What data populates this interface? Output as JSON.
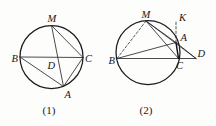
{
  "document": {
    "kind": "geometry-figure-pair",
    "background_color": "#fdfdfc",
    "ink_color": "#1b1b1e",
    "width": 216,
    "height": 126
  },
  "figures": [
    {
      "id": "figure-1",
      "caption": "(1)",
      "caption_pos": {
        "x": 49,
        "y": 114
      },
      "circle": {
        "cx": 51.5,
        "cy": 57,
        "r": 31.5
      },
      "points": [
        {
          "name": "M",
          "label": "M",
          "x": 51.5,
          "y": 25.5,
          "label_x": 47.5,
          "label_y": 21.5
        },
        {
          "name": "B",
          "label": "B",
          "x": 20.0,
          "y": 57.0,
          "label_x": 11.5,
          "label_y": 62.0
        },
        {
          "name": "C",
          "label": "C",
          "x": 83.0,
          "y": 57.5,
          "label_x": 85.0,
          "label_y": 62.0
        },
        {
          "name": "A",
          "label": "A",
          "x": 63.5,
          "y": 86.5,
          "label_x": 64.5,
          "label_y": 97.5
        },
        {
          "name": "D",
          "label": "D",
          "x": 53.5,
          "y": 57.2,
          "label_x": 47.5,
          "label_y": 69.0
        }
      ],
      "segments": [
        {
          "name": "BC",
          "from": "B",
          "to": "C",
          "style": "solid"
        },
        {
          "name": "MA",
          "from": "M",
          "to": "A",
          "style": "solid"
        },
        {
          "name": "MC",
          "from": "M",
          "to": "C",
          "style": "solid"
        },
        {
          "name": "BA",
          "from": "B",
          "to": "A",
          "style": "solid"
        },
        {
          "name": "AC",
          "from": "A",
          "to": "C",
          "style": "solid"
        }
      ]
    },
    {
      "id": "figure-2",
      "caption": "(2)",
      "caption_pos": {
        "x": 146,
        "y": 114
      },
      "circle": {
        "cx": 148.0,
        "cy": 52.5,
        "r": 32.0
      },
      "points": [
        {
          "name": "M",
          "label": "M",
          "x": 146.0,
          "y": 21.0,
          "label_x": 141.5,
          "label_y": 18.0
        },
        {
          "name": "B",
          "label": "B",
          "x": 117.0,
          "y": 58.5,
          "label_x": 108.5,
          "label_y": 63.5
        },
        {
          "name": "C",
          "label": "C",
          "x": 178.5,
          "y": 58.5,
          "label_x": 176.0,
          "label_y": 69.0
        },
        {
          "name": "A",
          "label": "A",
          "x": 176.0,
          "y": 42.5,
          "label_x": 180.5,
          "label_y": 41.0
        },
        {
          "name": "D",
          "label": "D",
          "x": 196.0,
          "y": 58.5,
          "label_x": 197.5,
          "label_y": 57.0
        },
        {
          "name": "K",
          "label": "K",
          "x": 176.0,
          "y": 21.5,
          "label_x": 179.0,
          "label_y": 21.0
        }
      ],
      "segments": [
        {
          "name": "BC",
          "from": "B",
          "to": "C",
          "style": "solid"
        },
        {
          "name": "BD",
          "from": "B",
          "to": "D",
          "style": "solid"
        },
        {
          "name": "MB",
          "from": "M",
          "to": "B",
          "style": "dashed"
        },
        {
          "name": "MA",
          "from": "M",
          "to": "A",
          "style": "solid"
        },
        {
          "name": "MC",
          "from": "M",
          "to": "C",
          "style": "solid"
        },
        {
          "name": "MD",
          "from": "M",
          "to": "D",
          "style": "solid"
        },
        {
          "name": "AC",
          "from": "A",
          "to": "C",
          "style": "heavy"
        },
        {
          "name": "AK",
          "from": "A",
          "to": "K",
          "style": "dashed"
        },
        {
          "name": "AD",
          "from": "A",
          "to": "D",
          "style": "solid"
        }
      ]
    }
  ]
}
